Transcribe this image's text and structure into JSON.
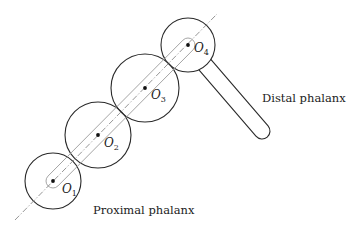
{
  "diagram": {
    "type": "finger joint kinematic sketch",
    "joints": [
      {
        "id": "O1",
        "letter": "O",
        "sub": "1",
        "cx": 53,
        "cy": 181,
        "r": 28,
        "label_x": 62,
        "label_y": 193
      },
      {
        "id": "O2",
        "letter": "O",
        "sub": "2",
        "cx": 98,
        "cy": 135,
        "r": 33,
        "label_x": 104,
        "label_y": 147
      },
      {
        "id": "O3",
        "letter": "O",
        "sub": "3",
        "cx": 145,
        "cy": 88,
        "r": 34,
        "label_x": 151,
        "label_y": 99
      },
      {
        "id": "O4",
        "letter": "O",
        "sub": "4",
        "cx": 188,
        "cy": 45,
        "r": 27,
        "label_x": 194,
        "label_y": 52
      }
    ],
    "axis": {
      "x1": 15,
      "y1": 220,
      "x2": 217,
      "y2": 14
    },
    "proximal_link": {
      "x1": 53,
      "y1": 181,
      "x2": 188,
      "y2": 45,
      "half_width": 7
    },
    "distal_link": {
      "x1": 188,
      "y1": 45,
      "x2": 262,
      "y2": 131,
      "half_width": 8
    },
    "labels": {
      "proximal": {
        "text": "Proximal phalanx",
        "x": 93,
        "y": 214
      },
      "distal": {
        "text": "Distal phalanx",
        "x": 262,
        "y": 102
      }
    },
    "colors": {
      "stroke": "#2a2a2a",
      "axis": "#8a8a8a",
      "capsule": "#9a9a9a",
      "background": "#ffffff"
    }
  }
}
